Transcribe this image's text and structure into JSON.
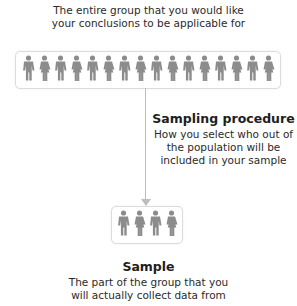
{
  "population": {
    "title": "Population",
    "description_lines": [
      "The entire group that you would like",
      "your conclusions to be applicable for"
    ],
    "figure_count": 16
  },
  "sampling": {
    "title": "Sampling procedure",
    "description_lines": [
      "How you select who out of",
      "the population will be",
      "included in your sample"
    ]
  },
  "sample": {
    "title": "Sample",
    "description_lines": [
      "The part of the group that you",
      "will actually collect data from"
    ],
    "figure_count": 4
  },
  "colors": {
    "figure": "#8c8c8c",
    "connector": "#bdbdbd",
    "box_border": "#dcdcdc"
  }
}
